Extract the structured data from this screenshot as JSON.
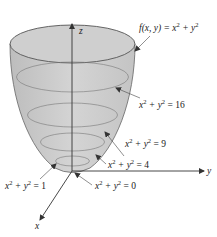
{
  "diagram": {
    "title_label": {
      "func": "f(x, y) = x",
      "exp1": "2",
      "plus": " + y",
      "exp2": "2"
    },
    "axes": {
      "z": "z",
      "y": "y",
      "x": "x"
    },
    "level_curves": [
      {
        "name": "16",
        "lhs_x": "x",
        "exp": "2",
        "mid": " + y",
        "rhs": " = 16"
      },
      {
        "name": "9",
        "lhs_x": "x",
        "exp": "2",
        "mid": " + y",
        "rhs": " = 9"
      },
      {
        "name": "4",
        "lhs_x": "x",
        "exp": "2",
        "mid": " + y",
        "rhs": " = 4"
      },
      {
        "name": "1",
        "lhs_x": "x",
        "exp": "2",
        "mid": " + y",
        "rhs": " = 1"
      },
      {
        "name": "0",
        "lhs_x": "x",
        "exp": "2",
        "mid": " + y",
        "rhs": " = 0"
      }
    ],
    "colors": {
      "surface_fill": "#c8c8c8",
      "stroke": "#555555",
      "axis": "#333333"
    }
  }
}
